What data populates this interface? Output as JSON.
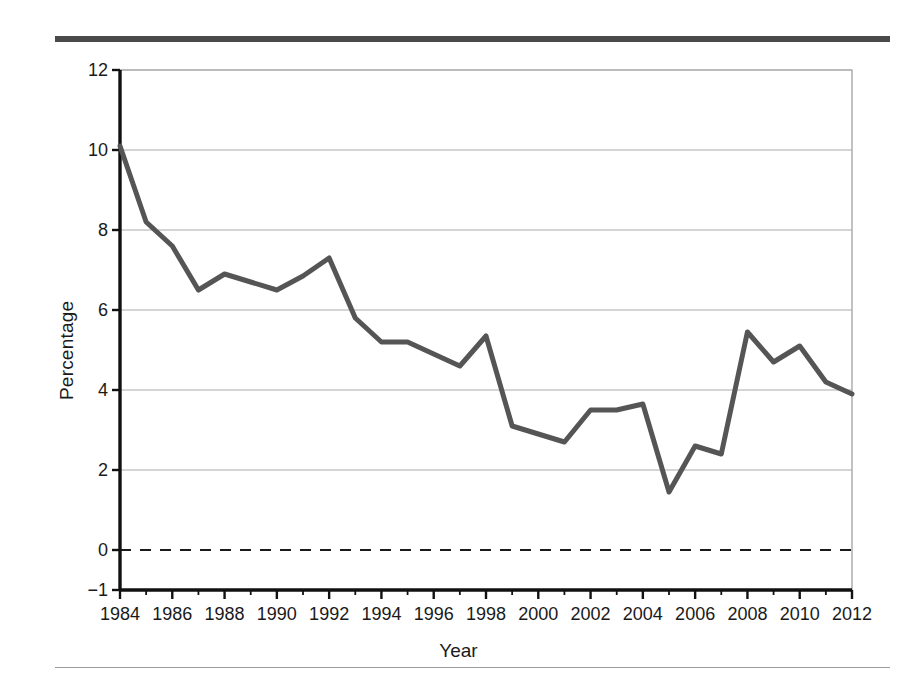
{
  "figure": {
    "top_rule_color": "#4a4a4a",
    "bottom_rule_color": "#9a9a9a",
    "background": "#ffffff"
  },
  "chart_data": {
    "type": "line",
    "title": "",
    "subtitle": "",
    "xlabel": "Year",
    "ylabel": "Percentage",
    "xlim": [
      1984,
      2012
    ],
    "ylim": [
      -1,
      12
    ],
    "grid": "horizontal",
    "legend": "none",
    "line_color": "#555555",
    "line_width": 5,
    "zero_line": {
      "value": 0,
      "style": "dashed",
      "color": "#1a1a1a"
    },
    "x_tick_labels": [
      "1984",
      "1986",
      "1988",
      "1990",
      "1992",
      "1994",
      "1996",
      "1998",
      "2000",
      "2002",
      "2004",
      "2006",
      "2008",
      "2010",
      "2012"
    ],
    "x_tick_values": [
      1984,
      1986,
      1988,
      1990,
      1992,
      1994,
      1996,
      1998,
      2000,
      2002,
      2004,
      2006,
      2008,
      2010,
      2012
    ],
    "x_minor_ticks": [
      1985,
      1987,
      1989,
      1991,
      1993,
      1995,
      1997,
      1999,
      2001,
      2003,
      2005,
      2007,
      2009,
      2011
    ],
    "y_tick_labels": [
      "−1",
      "0",
      "2",
      "4",
      "6",
      "8",
      "10",
      "12"
    ],
    "y_tick_values": [
      -1,
      0,
      2,
      4,
      6,
      8,
      10,
      12
    ],
    "gridline_values": [
      2,
      4,
      6,
      8,
      10,
      12
    ],
    "x": [
      1984,
      1985,
      1986,
      1987,
      1988,
      1989,
      1990,
      1991,
      1992,
      1993,
      1994,
      1995,
      1996,
      1997,
      1998,
      1999,
      2000,
      2001,
      2002,
      2003,
      2004,
      2005,
      2006,
      2007,
      2008,
      2009,
      2010,
      2011,
      2012
    ],
    "values": [
      10.1,
      8.2,
      7.6,
      6.5,
      6.9,
      6.7,
      6.5,
      6.85,
      7.3,
      5.8,
      5.2,
      5.2,
      4.9,
      4.6,
      5.35,
      3.1,
      2.9,
      2.7,
      3.5,
      3.5,
      3.65,
      1.45,
      2.6,
      2.4,
      5.45,
      4.7,
      5.1,
      4.2,
      3.9
    ],
    "series": [
      {
        "name": "Percentage",
        "values": [
          10.1,
          8.2,
          7.6,
          6.5,
          6.9,
          6.7,
          6.5,
          6.85,
          7.3,
          5.8,
          5.2,
          5.2,
          4.9,
          4.6,
          5.35,
          3.1,
          2.9,
          2.7,
          3.5,
          3.5,
          3.65,
          1.45,
          2.6,
          2.4,
          5.45,
          4.7,
          5.1,
          4.2,
          3.9
        ]
      }
    ]
  }
}
